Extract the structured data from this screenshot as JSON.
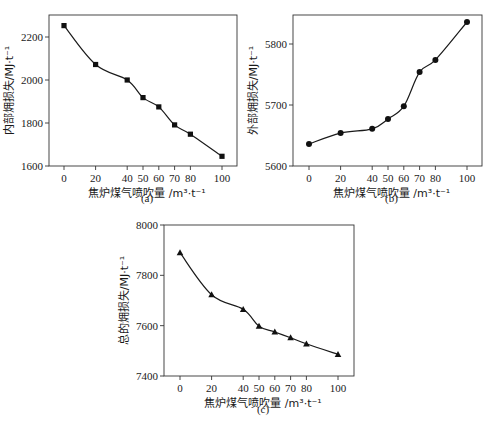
{
  "chart_data": [
    {
      "type": "line",
      "panel": "(a)",
      "caption": "(a)",
      "title": "",
      "xlabel": "焦炉煤气喷吹量 /m³·t⁻¹",
      "ylabel": "内部㶲损失/MJ·t⁻¹",
      "x": [
        0,
        20,
        40,
        50,
        60,
        70,
        80,
        100
      ],
      "values": [
        2253,
        2072,
        2000,
        1918,
        1875,
        1791,
        1748,
        1645
      ],
      "marker": "square",
      "xticks": [
        0,
        20,
        40,
        50,
        60,
        70,
        80,
        100
      ],
      "yticks": [
        1600,
        1800,
        2000,
        2200
      ],
      "ylim": [
        1600,
        2300
      ],
      "grid": false,
      "legend": null
    },
    {
      "type": "line",
      "panel": "(b)",
      "caption": "(b)",
      "title": "",
      "xlabel": "焦炉煤气喷吹量 /m³·t⁻¹",
      "ylabel": "外部㶲损失/MJ·t⁻¹",
      "x": [
        0,
        20,
        40,
        50,
        60,
        70,
        80,
        100
      ],
      "values": [
        5636,
        5654,
        5661,
        5677,
        5698,
        5754,
        5774,
        5836
      ],
      "marker": "circle",
      "xticks": [
        0,
        20,
        40,
        50,
        60,
        70,
        80,
        100
      ],
      "yticks": [
        5600,
        5700,
        5800
      ],
      "ylim": [
        5600,
        5850
      ],
      "grid": false,
      "legend": null
    },
    {
      "type": "line",
      "panel": "(c)",
      "caption": "(c)",
      "title": "",
      "xlabel": "焦炉煤气喷吹量 /m³·t⁻¹",
      "ylabel": "总的㶲损失/MJ·t⁻¹",
      "x": [
        0,
        20,
        40,
        50,
        60,
        70,
        80,
        100
      ],
      "values": [
        7890,
        7723,
        7665,
        7598,
        7575,
        7552,
        7528,
        7486
      ],
      "marker": "triangle",
      "xticks": [
        0,
        20,
        40,
        50,
        60,
        70,
        80,
        100
      ],
      "yticks": [
        7400,
        7600,
        7800,
        8000
      ],
      "ylim": [
        7400,
        8000
      ],
      "grid": false,
      "legend": null
    }
  ],
  "panels": {
    "a": {
      "ylabel": "内部㶲损失/MJ·t⁻¹",
      "xlabel_cn": "焦炉煤气喷吹量",
      "xlabel_unit": "/m³·t⁻¹",
      "caption": "(a)"
    },
    "b": {
      "ylabel": "外部㶲损失/MJ·t⁻¹",
      "xlabel_cn": "焦炉煤气喷吹量",
      "xlabel_unit": "/m³·t⁻¹",
      "caption": "(b)"
    },
    "c": {
      "ylabel": "总的㶲损失/MJ·t⁻¹",
      "xlabel_cn": "焦炉煤气喷吹量",
      "xlabel_unit": "/m³·t⁻¹",
      "caption": "(c)"
    }
  },
  "colors": {
    "line": "#1a1a1a",
    "marker": "#111111",
    "axis": "#333333"
  }
}
